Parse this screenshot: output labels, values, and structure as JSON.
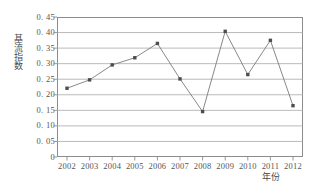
{
  "chart_data": {
    "type": "line",
    "title": "",
    "xlabel": "年份",
    "ylabel": "基流指数",
    "categories": [
      "2002",
      "2003",
      "2004",
      "2005",
      "2006",
      "2007",
      "2008",
      "2009",
      "2010",
      "2011",
      "2012"
    ],
    "values": [
      0.221,
      0.248,
      0.296,
      0.319,
      0.365,
      0.251,
      0.146,
      0.404,
      0.265,
      0.375,
      0.165
    ],
    "series": [
      {
        "name": "基流指数",
        "values": [
          0.221,
          0.248,
          0.296,
          0.319,
          0.365,
          0.251,
          0.146,
          0.404,
          0.265,
          0.375,
          0.165
        ]
      }
    ],
    "ylim": [
      0,
      0.45
    ],
    "yticks": [
      0,
      0.05,
      0.1,
      0.15,
      0.2,
      0.25,
      0.3,
      0.35,
      0.4,
      0.45
    ],
    "ytick_labels": [
      "0",
      "0. 05",
      "0. 10",
      "0. 15",
      "0. 20",
      "0. 25",
      "0. 30",
      "0. 35",
      "0. 40",
      "0. 45"
    ],
    "grid": true,
    "grid_axis": "y",
    "legend": false,
    "legend_position": "none",
    "marker": "square",
    "line_color": "#7a7a7a",
    "marker_color": "#4d4d4d",
    "grid_color": "#a8a8a8",
    "frame_color": "#8c8c8c",
    "background_color": "#ffffff"
  }
}
